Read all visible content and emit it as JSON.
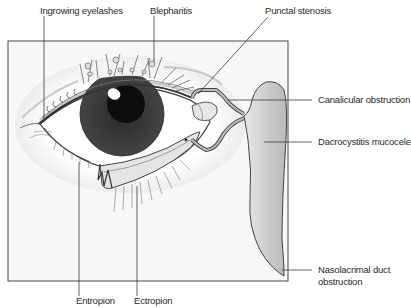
{
  "figure": {
    "type": "anatomical-illustration",
    "colors": {
      "frame": "#4a4a4a",
      "leader_line": "#3a3a3a",
      "iris": "#3c3c3c",
      "pupil": "#111111",
      "sac_fill": "#cfcfcf",
      "background": "#f6f6f6",
      "label_text": "#2a2a2a"
    }
  },
  "labels": {
    "ingrowing_eyelashes": "Ingrowing eyelashes",
    "blepharitis": "Blepharitis",
    "punctal_stenosis": "Punctal stenosis",
    "canalicular_obstruction": "Canalicular obstruction",
    "dacrocystitis_mucocele": "Dacrocystitis mucocele",
    "nasolacrimal_line1": "Nasolacrimal duct",
    "nasolacrimal_line2": "obstruction",
    "entropion": "Entropion",
    "ectropion": "Ectropion"
  }
}
